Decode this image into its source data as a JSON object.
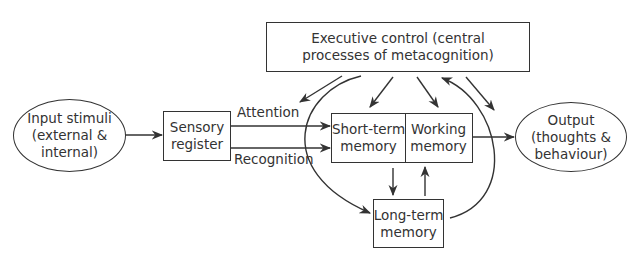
{
  "diagram": {
    "nodes": {
      "executive": {
        "lines": [
          "Executive control (central",
          "processes of metacognition)"
        ]
      },
      "input": {
        "lines": [
          "Input stimuli",
          "(external &",
          "internal)"
        ]
      },
      "sensory": {
        "lines": [
          "Sensory",
          "register"
        ]
      },
      "short_term": {
        "lines": [
          "Short-term",
          "memory"
        ]
      },
      "working": {
        "lines": [
          "Working",
          "memory"
        ]
      },
      "long_term": {
        "lines": [
          "Long-term",
          "memory"
        ]
      },
      "output": {
        "lines": [
          "Output",
          "(thoughts &",
          "behaviour)"
        ]
      }
    },
    "edge_labels": {
      "attention": "Attention",
      "recognition": "Recognition"
    },
    "colors": {
      "stroke": "#333333",
      "text": "#333333",
      "background": "#ffffff"
    }
  }
}
